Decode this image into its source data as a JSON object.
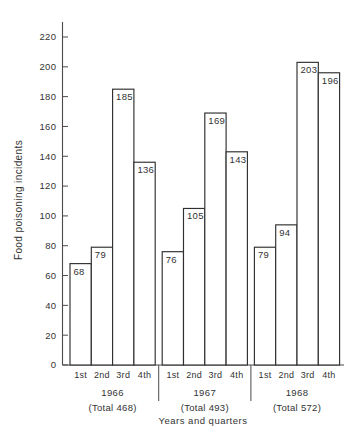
{
  "chart_data": {
    "type": "bar",
    "title": "",
    "xlabel": "Years and quarters",
    "ylabel": "Food poisoning incidents",
    "ylim": [
      0,
      220
    ],
    "ytick_step": 20,
    "yticks": [
      0,
      20,
      40,
      60,
      80,
      100,
      120,
      140,
      160,
      180,
      200,
      220
    ],
    "ytick_labels": [
      "0",
      "20",
      "40",
      "60",
      "80",
      "100",
      "120",
      "140",
      "160",
      "180",
      "200",
      "220"
    ],
    "grid": false,
    "legend": null,
    "categories": [
      "1st",
      "2nd",
      "3rd",
      "4th",
      "1st",
      "2nd",
      "3rd",
      "4th",
      "1st",
      "2nd",
      "3rd",
      "4th"
    ],
    "values": [
      68,
      79,
      185,
      136,
      76,
      105,
      169,
      143,
      79,
      94,
      203,
      196
    ],
    "bar_labels": [
      "68",
      "79",
      "185",
      "136",
      "76",
      "105",
      "169",
      "143",
      "79",
      "94",
      "203",
      "196"
    ],
    "groups": [
      {
        "year": "1966",
        "total_label": "(Total 468)",
        "total": 468,
        "quarters": [
          "1st",
          "2nd",
          "3rd",
          "4th"
        ],
        "values": [
          68,
          79,
          185,
          136
        ]
      },
      {
        "year": "1967",
        "total_label": "(Total 493)",
        "total": 493,
        "quarters": [
          "1st",
          "2nd",
          "3rd",
          "4th"
        ],
        "values": [
          76,
          105,
          169,
          143
        ]
      },
      {
        "year": "1968",
        "total_label": "(Total 572)",
        "total": 572,
        "quarters": [
          "1st",
          "2nd",
          "3rd",
          "4th"
        ],
        "values": [
          79,
          94,
          203,
          196
        ]
      }
    ],
    "colors": {
      "bar_fill": "#ffffff",
      "bar_stroke": "#2f2f2f",
      "axis": "#4a4a4a",
      "text": "#333333",
      "background": "#ffffff"
    }
  }
}
